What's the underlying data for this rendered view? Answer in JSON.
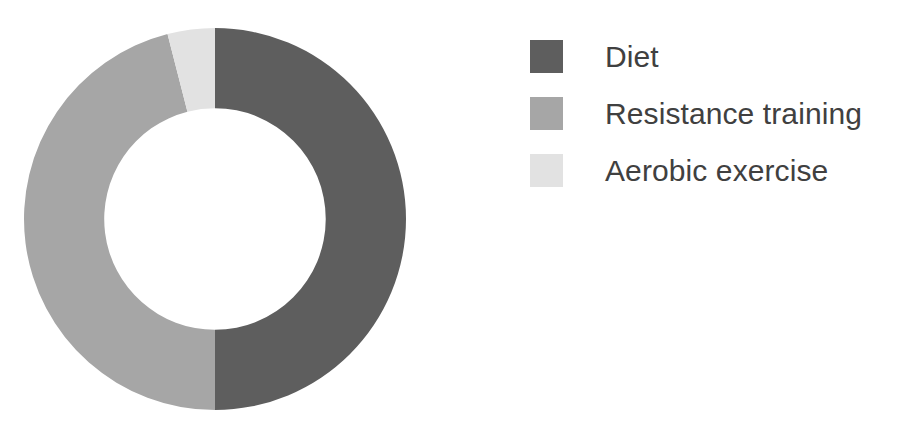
{
  "chart_data": {
    "type": "pie",
    "variant": "donut",
    "title": "",
    "subtitle": "",
    "xlabel": "",
    "ylabel": "",
    "grid": false,
    "legend_position": "right",
    "start_angle_deg": 0,
    "direction": "clockwise",
    "inner_radius_ratio": 0.58,
    "categories": [
      "Diet",
      "Resistance training",
      "Aerobic exercise"
    ],
    "values": [
      50,
      46,
      4
    ],
    "value_unit": "%",
    "colors": [
      "#5e5e5e",
      "#a6a6a6",
      "#e2e2e2"
    ],
    "slices": [
      {
        "label": "Diet",
        "value": 50,
        "color": "#5e5e5e",
        "start_angle_deg": 0,
        "end_angle_deg": 180
      },
      {
        "label": "Resistance training",
        "value": 46,
        "color": "#a6a6a6",
        "start_angle_deg": 180,
        "end_angle_deg": 345.6
      },
      {
        "label": "Aerobic exercise",
        "value": 4,
        "color": "#e2e2e2",
        "start_angle_deg": 345.6,
        "end_angle_deg": 360
      }
    ]
  },
  "legend": {
    "items": [
      {
        "label": "Diet",
        "color": "#5e5e5e"
      },
      {
        "label": "Resistance training",
        "color": "#a6a6a6"
      },
      {
        "label": "Aerobic exercise",
        "color": "#e2e2e2"
      }
    ]
  },
  "canvas": {
    "background": "#ffffff",
    "text_color": "#404040"
  }
}
